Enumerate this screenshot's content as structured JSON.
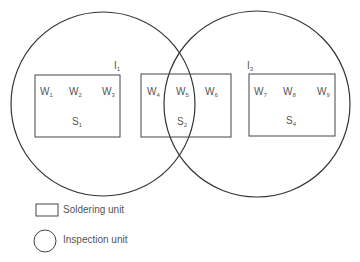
{
  "diagram": {
    "circles": [
      {
        "id": "I1",
        "label": "I",
        "sub": "1",
        "cx": 103,
        "cy": 104,
        "r": 92
      },
      {
        "id": "I3",
        "label": "I",
        "sub": "3",
        "cx": 257,
        "cy": 104,
        "r": 93
      }
    ],
    "boxes": [
      {
        "id": "S1",
        "x": 35,
        "y": 75,
        "w": 85,
        "h": 62,
        "label": "S",
        "sub": "1"
      },
      {
        "id": "S2",
        "x": 141,
        "y": 74,
        "w": 90,
        "h": 63,
        "label": "S",
        "sub": "2"
      },
      {
        "id": "S4",
        "x": 249,
        "y": 74,
        "w": 86,
        "h": 62,
        "label": "S",
        "sub": "4"
      }
    ],
    "workstations": [
      {
        "label": "W",
        "sub": "1"
      },
      {
        "label": "W",
        "sub": "2"
      },
      {
        "label": "W",
        "sub": "3"
      },
      {
        "label": "W",
        "sub": "4"
      },
      {
        "label": "W",
        "sub": "5"
      },
      {
        "label": "W",
        "sub": "6"
      },
      {
        "label": "W",
        "sub": "7"
      },
      {
        "label": "W",
        "sub": "8"
      },
      {
        "label": "W",
        "sub": "9"
      }
    ],
    "stroke_color": "#333333",
    "text_color": "#555555"
  },
  "legend": {
    "items": [
      {
        "shape": "rectangle",
        "label": "Soldering unit"
      },
      {
        "shape": "circle",
        "label": "Inspection unit"
      }
    ]
  }
}
